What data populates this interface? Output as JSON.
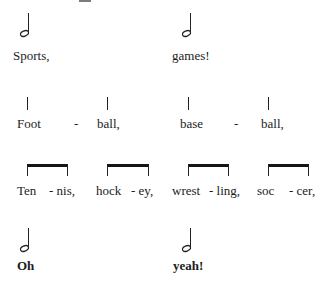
{
  "notation": {
    "row1": {
      "notes": [
        {
          "type": "half-note",
          "x": 28
        },
        {
          "type": "half-note",
          "x": 190
        }
      ],
      "lyrics": [
        {
          "text": "Sports,",
          "x": 13
        },
        {
          "text": "games!",
          "x": 172
        }
      ]
    },
    "row2": {
      "notes": [
        {
          "type": "quarter-stem",
          "x": 27
        },
        {
          "type": "quarter-stem",
          "x": 107
        },
        {
          "type": "quarter-stem",
          "x": 188
        },
        {
          "type": "quarter-stem",
          "x": 268
        }
      ],
      "lyrics": [
        {
          "text": "Foot",
          "x": 17
        },
        {
          "text": "-",
          "x": 74
        },
        {
          "text": "ball,",
          "x": 97
        },
        {
          "text": "base",
          "x": 180
        },
        {
          "text": "-",
          "x": 234
        },
        {
          "text": "ball,",
          "x": 261
        }
      ]
    },
    "row3": {
      "beams": [
        {
          "x1": 27,
          "x2": 67
        },
        {
          "x1": 107,
          "x2": 148
        },
        {
          "x1": 188,
          "x2": 228
        },
        {
          "x1": 268,
          "x2": 308
        }
      ],
      "lyrics": [
        {
          "text": "Ten",
          "x": 17
        },
        {
          "text": "- nis,",
          "x": 49
        },
        {
          "text": "hock",
          "x": 96
        },
        {
          "text": "- ey,",
          "x": 131
        },
        {
          "text": "wrest",
          "x": 172
        },
        {
          "text": "- ling,",
          "x": 209
        },
        {
          "text": "soc",
          "x": 257
        },
        {
          "text": "- cer,",
          "x": 289
        }
      ]
    },
    "row4": {
      "notes": [
        {
          "type": "half-note",
          "x": 28
        },
        {
          "type": "half-note",
          "x": 190
        }
      ],
      "lyrics": [
        {
          "text": "Oh",
          "x": 17
        },
        {
          "text": "yeah!",
          "x": 173
        }
      ]
    }
  }
}
